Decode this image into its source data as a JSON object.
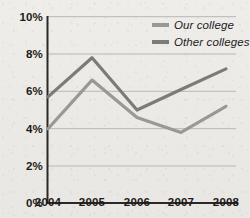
{
  "chart_data": {
    "type": "line",
    "title": "",
    "xlabel": "",
    "ylabel": "",
    "categories": [
      "2004",
      "2005",
      "2006",
      "2007",
      "2008"
    ],
    "x": [
      2004,
      2005,
      2006,
      2007,
      2008
    ],
    "series": [
      {
        "name": "Our college",
        "color": "#9a9894",
        "values": [
          4.0,
          6.6,
          4.6,
          3.8,
          5.2
        ],
        "value_labels": [
          "4.0%",
          "6.6%",
          "4.6%",
          "3.8%",
          "5.2%"
        ]
      },
      {
        "name": "Other colleges",
        "color": "#7d7b78",
        "values": [
          5.7,
          7.8,
          5.0,
          6.1,
          7.2
        ],
        "value_labels": [
          "5.7%",
          "7.8%",
          "5.0%",
          "6.1%",
          "7.2%"
        ]
      }
    ],
    "ylim": [
      0,
      10
    ],
    "yticks": [
      0,
      2,
      4,
      6,
      8,
      10
    ],
    "ytick_labels": [
      "0%",
      "2%",
      "4%",
      "6%",
      "8%",
      "10%"
    ],
    "xtick_labels": [
      "2004",
      "2005",
      "2006",
      "2007",
      "2008"
    ],
    "grid": "horizontal",
    "legend_position": "top-right",
    "axis_color": "#33312e",
    "grid_color": "#b9b7b3",
    "background_color": "#edebe8"
  },
  "axis": {
    "y_ticks": [
      {
        "label": "10%",
        "value": 10
      },
      {
        "label": "8%",
        "value": 8
      },
      {
        "label": "6%",
        "value": 6
      },
      {
        "label": "4%",
        "value": 4
      },
      {
        "label": "2%",
        "value": 2
      },
      {
        "label": "0%",
        "value": 0
      }
    ],
    "x_ticks": [
      {
        "label": "2004"
      },
      {
        "label": "2005"
      },
      {
        "label": "2006"
      },
      {
        "label": "2007"
      },
      {
        "label": "2008"
      }
    ]
  },
  "legend": {
    "items": [
      {
        "label": "Our college",
        "color": "#9a9894"
      },
      {
        "label": "Other colleges",
        "color": "#7d7b78"
      }
    ]
  }
}
